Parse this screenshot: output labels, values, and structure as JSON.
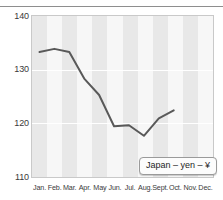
{
  "chart_data": {
    "type": "line",
    "title": "",
    "subtitle": "",
    "xlabel": "",
    "ylabel": "",
    "categories": [
      "Jan.",
      "Feb.",
      "Mar.",
      "Apr.",
      "May",
      "Jun.",
      "Jul.",
      "Aug.",
      "Sept.",
      "Oct.",
      "Nov.",
      "Dec."
    ],
    "series": [
      {
        "name": "Japan – yen – ¥",
        "values": [
          133.2,
          133.8,
          133.2,
          128.2,
          125.1,
          119.2,
          119.4,
          117.4,
          120.7,
          122.2,
          null,
          null
        ],
        "color": "#595959"
      }
    ],
    "ylim": [
      110,
      140
    ],
    "yticks": [
      110,
      120,
      130,
      140
    ],
    "ytick_labels": [
      "110",
      "120",
      "130",
      "140"
    ],
    "grid": "horizontal-white-gridlines-at-120-and-130",
    "banding": "alternating vertical month bands",
    "legend": {
      "position": "bottom-right",
      "entries": [
        "Japan – yen – ¥"
      ]
    },
    "annotations": []
  },
  "legend": {
    "label": "Japan – yen – ¥"
  },
  "colors": {
    "line": "#595959",
    "plot_background": "#f7f7f7",
    "band": "#e8e8e8",
    "gridline": "#ffffff",
    "axis_border": "#c9c9c9",
    "top_rule": "#8e8e8e",
    "tick_text": "#3a3a3a"
  }
}
